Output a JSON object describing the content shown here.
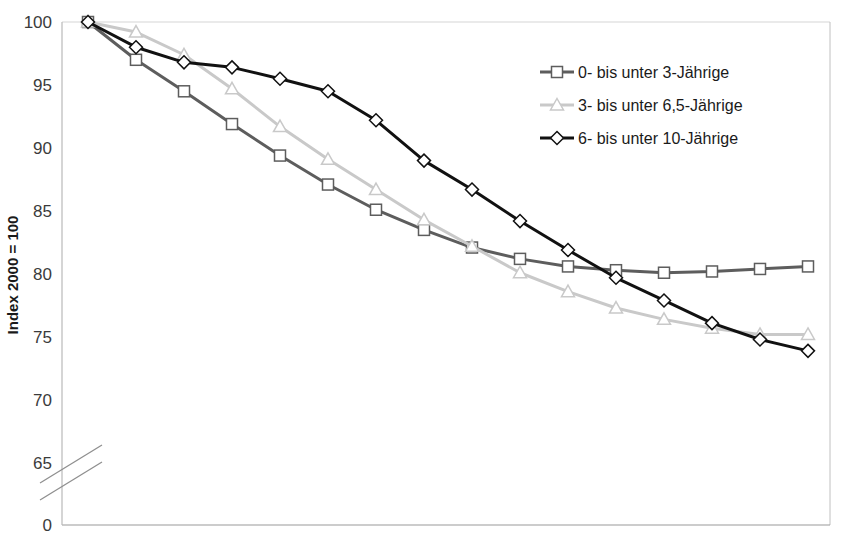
{
  "chart_data": {
    "type": "line",
    "title": "",
    "subtitle": "",
    "xlabel": "",
    "ylabel": "Index 2000 = 100",
    "ylim": [
      63.5,
      100
    ],
    "yticks": [
      100,
      95,
      90,
      85,
      80,
      75,
      70,
      65,
      0
    ],
    "ytick_labels": [
      "100",
      "95",
      "90",
      "85",
      "80",
      "75",
      "70",
      "65",
      "0"
    ],
    "axis_break": true,
    "axis_break_between": [
      65,
      0
    ],
    "grid": false,
    "legend_position": "top-right",
    "x": [
      0,
      1,
      2,
      3,
      4,
      5,
      6,
      7,
      8,
      9,
      10,
      11,
      12,
      13,
      14,
      15
    ],
    "xtick_labels": [],
    "series": [
      {
        "name": "0- bis unter 3-Jährige",
        "color": "#5d5d5d",
        "marker": "square",
        "values": [
          100.0,
          97.0,
          94.5,
          91.9,
          89.4,
          87.1,
          85.1,
          83.5,
          82.1,
          81.2,
          80.6,
          80.3,
          80.1,
          80.2,
          80.4,
          80.6
        ]
      },
      {
        "name": "3- bis unter 6,5-Jährige",
        "color": "#c9c9c9",
        "marker": "triangle",
        "values": [
          100.0,
          99.2,
          97.4,
          94.7,
          91.7,
          89.1,
          86.7,
          84.3,
          82.2,
          80.1,
          78.6,
          77.3,
          76.4,
          75.7,
          75.2,
          75.2
        ]
      },
      {
        "name": "6- bis unter 10-Jährige",
        "color": "#111111",
        "marker": "diamond",
        "values": [
          100.0,
          98.0,
          96.8,
          96.4,
          95.5,
          94.5,
          92.2,
          89.0,
          86.7,
          84.2,
          81.9,
          79.7,
          77.9,
          76.1,
          74.8,
          73.9
        ]
      }
    ]
  },
  "axis": {
    "y_title": "Index 2000 = 100",
    "zero_label": "0"
  },
  "legend": {
    "entries": [
      {
        "label": "0- bis unter 3-Jährige",
        "marker": "square-marker",
        "color": "#5d5d5d"
      },
      {
        "label": "3- bis unter 6,5-Jährige",
        "marker": "triangle-marker",
        "color": "#c9c9c9"
      },
      {
        "label": "6- bis unter 10-Jährige",
        "marker": "diamond-marker",
        "color": "#111111"
      }
    ]
  },
  "colors": {
    "plot_border": "#b9b9b9",
    "background": "#ffffff",
    "tick_text": "#3b3b3b",
    "axis_title": "#1a1a1a"
  }
}
